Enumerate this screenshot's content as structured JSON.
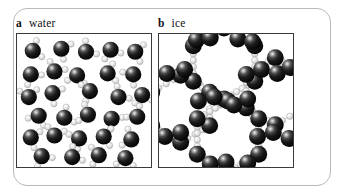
{
  "figure": {
    "background_color": "#ffffff",
    "frame_color": "#b9b9b9",
    "panel_border_color": "#3a3a3a"
  },
  "panels": [
    {
      "id": "water",
      "letter": "a",
      "label": "water",
      "description": "Disordered liquid water: randomly oriented H2O molecules packed closely together"
    },
    {
      "id": "ice",
      "letter": "b",
      "label": "ice",
      "description": "Crystalline ice: H2O molecules arranged in an open hexagonal lattice with hydrogen-bonded rings"
    }
  ],
  "legend": {
    "oxygen_color": "#141414",
    "oxygen_highlight_color": "#e8e8e8",
    "hydrogen_color": "#e2e2e2",
    "hydrogen_outline_color": "#9a9a9a",
    "bond_color": "#bdbdbd"
  },
  "chart_data": {
    "type": "scatter",
    "title": "",
    "xlabel": "",
    "ylabel": "",
    "panels": [
      {
        "name": "water",
        "letter": "a",
        "xlim": [
          0,
          136
        ],
        "ylim": [
          0,
          135
        ],
        "atom_radius": {
          "oxygen": 8.2,
          "hydrogen": 3.2
        },
        "molecules": [
          {
            "ox": 16,
            "oy": 17,
            "rot": -18
          },
          {
            "ox": 45,
            "oy": 15,
            "rot": 26
          },
          {
            "ox": 70,
            "oy": 18,
            "rot": -40
          },
          {
            "ox": 95,
            "oy": 16,
            "rot": 70
          },
          {
            "ox": 120,
            "oy": 18,
            "rot": 12
          },
          {
            "ox": 14,
            "oy": 41,
            "rot": 55
          },
          {
            "ox": 38,
            "oy": 38,
            "rot": -62
          },
          {
            "ox": 61,
            "oy": 42,
            "rot": 100
          },
          {
            "ox": 92,
            "oy": 40,
            "rot": -10
          },
          {
            "ox": 118,
            "oy": 41,
            "rot": 140
          },
          {
            "ox": 12,
            "oy": 64,
            "rot": -95
          },
          {
            "ox": 36,
            "oy": 60,
            "rot": 30
          },
          {
            "ox": 74,
            "oy": 58,
            "rot": 165
          },
          {
            "ox": 103,
            "oy": 64,
            "rot": -45
          },
          {
            "ox": 127,
            "oy": 62,
            "rot": 80
          },
          {
            "ox": 22,
            "oy": 83,
            "rot": 115
          },
          {
            "ox": 48,
            "oy": 85,
            "rot": -28
          },
          {
            "ox": 72,
            "oy": 82,
            "rot": 200
          },
          {
            "ox": 96,
            "oy": 86,
            "rot": 45
          },
          {
            "ox": 122,
            "oy": 84,
            "rot": -130
          },
          {
            "ox": 14,
            "oy": 105,
            "rot": 20
          },
          {
            "ox": 38,
            "oy": 103,
            "rot": -75
          },
          {
            "ox": 63,
            "oy": 106,
            "rot": 150
          },
          {
            "ox": 88,
            "oy": 104,
            "rot": 5
          },
          {
            "ox": 116,
            "oy": 107,
            "rot": -160
          },
          {
            "ox": 25,
            "oy": 124,
            "rot": 60
          },
          {
            "ox": 56,
            "oy": 125,
            "rot": -35
          },
          {
            "ox": 83,
            "oy": 123,
            "rot": 175
          },
          {
            "ox": 110,
            "oy": 126,
            "rot": 95
          }
        ]
      },
      {
        "name": "ice",
        "letter": "b",
        "xlim": [
          0,
          136
        ],
        "ylim": [
          0,
          135
        ],
        "atom_radius": {
          "oxygen": 8.6,
          "hydrogen": 3.3
        },
        "ring_centers": [
          {
            "cx": 66,
            "cy": 30,
            "r": 36
          },
          {
            "cx": 22,
            "cy": 76,
            "r": 34
          },
          {
            "cx": 70,
            "cy": 104,
            "r": 36
          },
          {
            "cx": 118,
            "cy": 58,
            "r": 34
          }
        ],
        "oxygen_positions": [
          {
            "x": 38,
            "y": 6
          },
          {
            "x": 52,
            "y": 4
          },
          {
            "x": 80,
            "y": 5
          },
          {
            "x": 95,
            "y": 8
          },
          {
            "x": 8,
            "y": 40
          },
          {
            "x": 26,
            "y": 36
          },
          {
            "x": 104,
            "y": 36
          },
          {
            "x": 120,
            "y": 40
          },
          {
            "x": 133,
            "y": 34
          },
          {
            "x": 40,
            "y": 68
          },
          {
            "x": 56,
            "y": 64
          },
          {
            "x": 76,
            "y": 72
          },
          {
            "x": 90,
            "y": 66
          },
          {
            "x": 6,
            "y": 104
          },
          {
            "x": 22,
            "y": 100
          },
          {
            "x": 100,
            "y": 104
          },
          {
            "x": 116,
            "y": 100
          },
          {
            "x": 132,
            "y": 106
          },
          {
            "x": 52,
            "y": 132
          },
          {
            "x": 68,
            "y": 130
          },
          {
            "x": 90,
            "y": 131
          }
        ]
      }
    ]
  }
}
